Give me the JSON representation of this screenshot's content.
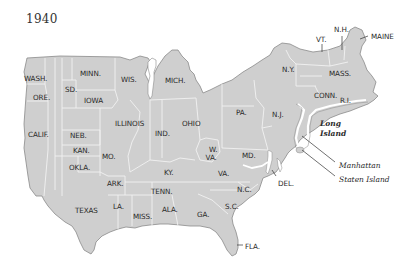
{
  "map": {
    "year": "1940",
    "fill_color": "#cfcfcf",
    "border_color": "#f2f2f2",
    "outline_color": "#8a8a8a",
    "states": [
      {
        "label": "WASH.",
        "x": 24,
        "y": 75
      },
      {
        "label": "ORE.",
        "x": 33,
        "y": 94
      },
      {
        "label": "CALIF.",
        "x": 28,
        "y": 131
      },
      {
        "label": "SD.",
        "x": 65,
        "y": 86
      },
      {
        "label": "MINN.",
        "x": 80,
        "y": 70
      },
      {
        "label": "WIS.",
        "x": 121,
        "y": 76
      },
      {
        "label": "IOWA",
        "x": 84,
        "y": 97
      },
      {
        "label": "MICH.",
        "x": 165,
        "y": 77
      },
      {
        "label": "ILLINOIS",
        "x": 115,
        "y": 120
      },
      {
        "label": "IND.",
        "x": 155,
        "y": 130
      },
      {
        "label": "OHIO",
        "x": 182,
        "y": 120
      },
      {
        "label": "NEB.",
        "x": 70,
        "y": 132
      },
      {
        "label": "KAN.",
        "x": 73,
        "y": 147
      },
      {
        "label": "MO.",
        "x": 102,
        "y": 153
      },
      {
        "label": "OKLA.",
        "x": 69,
        "y": 164
      },
      {
        "label": "ARK.",
        "x": 107,
        "y": 180
      },
      {
        "label": "TEXAS",
        "x": 75,
        "y": 207
      },
      {
        "label": "LA.",
        "x": 113,
        "y": 203
      },
      {
        "label": "MISS.",
        "x": 133,
        "y": 213
      },
      {
        "label": "TENN.",
        "x": 151,
        "y": 188
      },
      {
        "label": "ALA.",
        "x": 162,
        "y": 206
      },
      {
        "label": "GA.",
        "x": 197,
        "y": 211
      },
      {
        "label": "KY.",
        "x": 164,
        "y": 169
      },
      {
        "label": "W. VA.",
        "x": 205,
        "y": 146,
        "multiline": [
          "W.",
          "VA."
        ]
      },
      {
        "label": "VA.",
        "x": 218,
        "y": 170
      },
      {
        "label": "N.C.",
        "x": 237,
        "y": 186
      },
      {
        "label": "S.C.",
        "x": 225,
        "y": 203
      },
      {
        "label": "FLA.",
        "x": 245,
        "y": 243
      },
      {
        "label": "MD.",
        "x": 242,
        "y": 152
      },
      {
        "label": "DEL.",
        "x": 278,
        "y": 180
      },
      {
        "label": "PA.",
        "x": 236,
        "y": 109
      },
      {
        "label": "N.J.",
        "x": 272,
        "y": 111
      },
      {
        "label": "N.Y.",
        "x": 282,
        "y": 66
      },
      {
        "label": "MASS.",
        "x": 329,
        "y": 70
      },
      {
        "label": "CONN.",
        "x": 314,
        "y": 92
      },
      {
        "label": "R.I.",
        "x": 340,
        "y": 97
      },
      {
        "label": "VT.",
        "x": 316,
        "y": 36
      },
      {
        "label": "N.H.",
        "x": 334,
        "y": 26
      },
      {
        "label": "MAINE",
        "x": 371,
        "y": 33
      }
    ],
    "callouts": [
      {
        "label": "Long Island",
        "lines": [
          "Long",
          "Island"
        ],
        "x": 320,
        "y": 120,
        "bold": true
      },
      {
        "label": "Manhattan",
        "x": 339,
        "y": 162
      },
      {
        "label": "Staten Island",
        "x": 339,
        "y": 176
      }
    ]
  }
}
